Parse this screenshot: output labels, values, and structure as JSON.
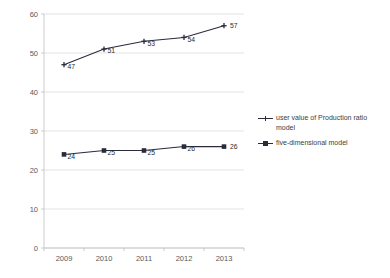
{
  "chart_data": {
    "type": "line",
    "title": "",
    "xlabel": "",
    "ylabel": "",
    "categories": [
      "2009",
      "2010",
      "2011",
      "2012",
      "2013"
    ],
    "ylim": [
      0,
      60
    ],
    "yticks": [
      0,
      10,
      20,
      30,
      40,
      50,
      60
    ],
    "ytick_labels": [
      "0",
      "10",
      "20",
      "30",
      "40",
      "50",
      "60"
    ],
    "grid": true,
    "legend_position": "right",
    "series": [
      {
        "name": "user value of Production ratio model",
        "marker": "cross",
        "color": "#2a2a3c",
        "values": [
          47,
          51,
          53,
          54,
          57
        ],
        "data_labels": [
          "47",
          "51",
          "53",
          "54",
          "57"
        ]
      },
      {
        "name": "five-dimensional model",
        "marker": "square",
        "color": "#2a2a3c",
        "values": [
          24,
          25,
          25,
          26,
          26
        ],
        "data_labels": [
          "24",
          "25",
          "25",
          "26",
          "26"
        ]
      }
    ]
  },
  "legend": {
    "entries": [
      {
        "label": "user value of Production ratio model",
        "marker": "cross-line-marker"
      },
      {
        "label": "five-dimensional model",
        "marker": "square-line-marker"
      }
    ]
  }
}
